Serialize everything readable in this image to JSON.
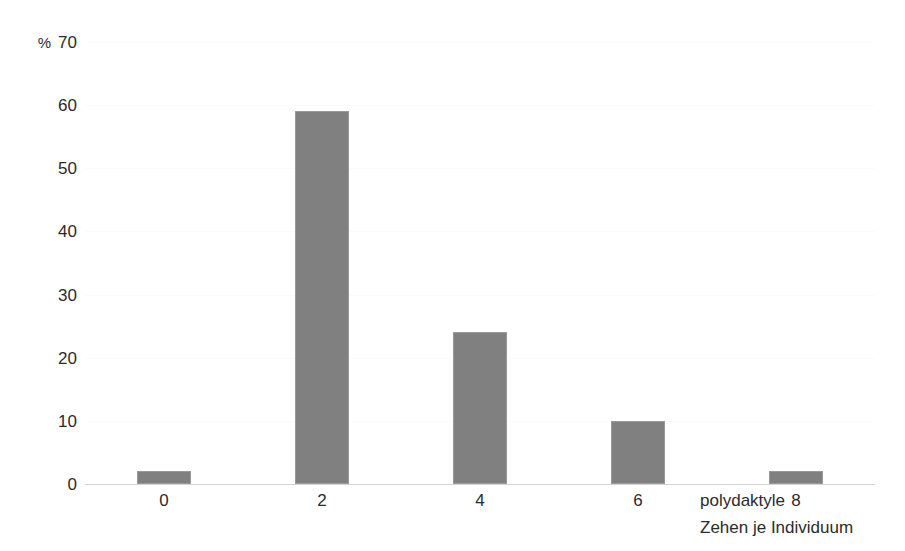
{
  "chart_data": {
    "type": "bar",
    "title": "",
    "subtitle": "",
    "categories": [
      "0",
      "2",
      "4",
      "6",
      "8"
    ],
    "values": [
      2,
      59,
      24,
      10,
      2
    ],
    "xlabel": "polydaktyle Zehen je Individuum",
    "xlabel_lines": [
      "polydaktyle",
      "Zehen je Individuum"
    ],
    "ylabel": "%",
    "ylim": [
      0,
      70
    ],
    "ytick_step": 10,
    "yticks": [
      70,
      60,
      50,
      40,
      30,
      20,
      10,
      0
    ],
    "ytick_labels": [
      "70",
      "60",
      "50",
      "40",
      "30",
      "20",
      "10",
      "0"
    ],
    "xticks": [
      "0",
      "2",
      "4",
      "6",
      "8"
    ],
    "grid": false,
    "legend": "none",
    "bar_color": "#808080",
    "bar_edge_color": "#9a9a9a",
    "axis_color": "#d4d4d4",
    "background_color": "#ffffff",
    "unit_symbol": "%"
  },
  "axis": {
    "y_unit": "%"
  }
}
